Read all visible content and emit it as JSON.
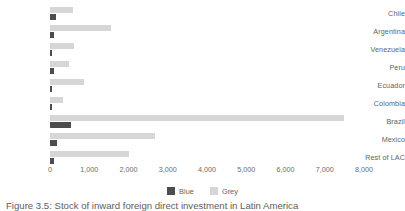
{
  "chart_data": {
    "type": "bar",
    "orientation": "horizontal",
    "title": "",
    "xlabel": "",
    "ylabel": "",
    "xlim": [
      0,
      8000
    ],
    "xticks": [
      0,
      1000,
      2000,
      3000,
      4000,
      5000,
      6000,
      7000,
      8000
    ],
    "xtick_labels": [
      "0",
      "1,000",
      "2,000",
      "3,000",
      "4,000",
      "5,000",
      "6,000",
      "7,000",
      "8,000"
    ],
    "grid": false,
    "legend_position": "bottom",
    "categories": [
      "Chile",
      "Argentina",
      "Venezuela",
      "Peru",
      "Ecuador",
      "Colombia",
      "Brazil",
      "Mexico",
      "Rest of LAC"
    ],
    "series": [
      {
        "name": "Blue",
        "color": "#4d4d4d",
        "values": [
          150,
          110,
          45,
          110,
          45,
          40,
          540,
          185,
          110
        ]
      },
      {
        "name": "Grey",
        "color": "#d6d6d6",
        "values": [
          575,
          1550,
          600,
          490,
          860,
          320,
          7500,
          2680,
          2020
        ]
      }
    ]
  },
  "legend": {
    "items": [
      {
        "label": "Blue",
        "color": "#4d4d4d"
      },
      {
        "label": "Grey",
        "color": "#d6d6d6"
      }
    ]
  },
  "caption": {
    "text": "Figure 3.5: Stock of inward foreign direct investment in Latin America"
  }
}
